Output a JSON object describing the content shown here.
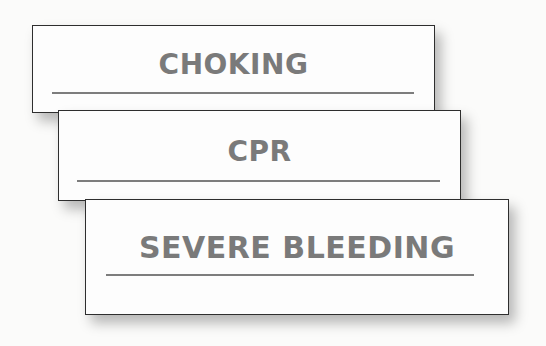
{
  "cards": [
    {
      "title": "CHOKING"
    },
    {
      "title": "CPR"
    },
    {
      "title": "SEVERE BLEEDING"
    }
  ],
  "colors": {
    "title_text": "#7a7a7a",
    "border": "#2e2e2e",
    "rule": "#7d7d7d",
    "background": "#fbfbfa"
  }
}
